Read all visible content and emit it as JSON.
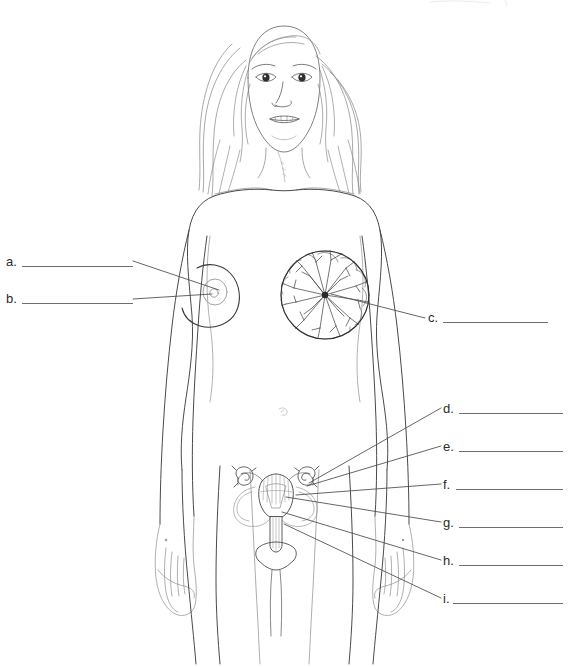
{
  "document": {
    "type": "anatomy-labeling-worksheet",
    "subject": "Female reproductive system and mammary gland",
    "background_color": "#ffffff",
    "ink_color": "#3a3a3a",
    "label_text_color": "#2b2b2b",
    "answer_line_color": "#6e6e6e"
  },
  "figure": {
    "name": "female-body-anterior-view",
    "parts": [
      "head-and-face",
      "long-hair",
      "neck-and-clavicle",
      "torso",
      "left-arm",
      "right-arm",
      "left-hand",
      "right-hand",
      "navel",
      "intact-breast-with-nipple",
      "cutaway-breast-mammary-lobules",
      "uterus-overlay",
      "legs"
    ]
  },
  "labels": {
    "left_column": [
      {
        "id": "a",
        "marker": "a.",
        "marker_x": 6,
        "marker_y": 255,
        "line_x": 22,
        "line_y": 266,
        "line_width": 111,
        "answer": ""
      },
      {
        "id": "b",
        "marker": "b.",
        "marker_x": 6,
        "marker_y": 292,
        "line_x": 22,
        "line_y": 303,
        "line_width": 111,
        "answer": ""
      }
    ],
    "right_column": [
      {
        "id": "c",
        "marker": "c.",
        "marker_x": 428,
        "marker_y": 311,
        "line_x": 443,
        "line_y": 322,
        "line_width": 105,
        "answer": ""
      },
      {
        "id": "d",
        "marker": "d.",
        "marker_x": 443,
        "marker_y": 402,
        "line_x": 459,
        "line_y": 413,
        "line_width": 104,
        "answer": ""
      },
      {
        "id": "e",
        "marker": "e.",
        "marker_x": 443,
        "marker_y": 440,
        "line_x": 459,
        "line_y": 451,
        "line_width": 104,
        "answer": ""
      },
      {
        "id": "f",
        "marker": "f.",
        "marker_x": 443,
        "marker_y": 478,
        "line_x": 456,
        "line_y": 489,
        "line_width": 107,
        "answer": ""
      },
      {
        "id": "g",
        "marker": "g.",
        "marker_x": 443,
        "marker_y": 516,
        "line_x": 459,
        "line_y": 527,
        "line_width": 104,
        "answer": ""
      },
      {
        "id": "h",
        "marker": "h.",
        "marker_x": 443,
        "marker_y": 554,
        "line_x": 459,
        "line_y": 565,
        "line_width": 104,
        "answer": ""
      },
      {
        "id": "i",
        "marker": "i.",
        "marker_x": 443,
        "marker_y": 592,
        "line_x": 453,
        "line_y": 603,
        "line_width": 110,
        "answer": ""
      }
    ]
  },
  "leader_lines": [
    {
      "for": "a",
      "from_x": 133,
      "from_y": 261,
      "to_x": 219,
      "to_y": 290,
      "target": "areola"
    },
    {
      "for": "b",
      "from_x": 133,
      "from_y": 299,
      "to_x": 214,
      "to_y": 294,
      "target": "nipple"
    },
    {
      "for": "c",
      "from_x": 425,
      "from_y": 318,
      "to_x": 331,
      "to_y": 293,
      "target": "mammary-lobules"
    },
    {
      "for": "d",
      "from_x": 441,
      "from_y": 408,
      "to_x": 308,
      "to_y": 484,
      "target": "fallopian-tube"
    },
    {
      "for": "e",
      "from_x": 441,
      "from_y": 446,
      "to_x": 306,
      "to_y": 486,
      "target": "ovary"
    },
    {
      "for": "f",
      "from_x": 441,
      "from_y": 484,
      "to_x": 296,
      "to_y": 495,
      "target": "uterus-fundus"
    },
    {
      "for": "g",
      "from_x": 441,
      "from_y": 522,
      "to_x": 285,
      "to_y": 497,
      "target": "endometrium"
    },
    {
      "for": "h",
      "from_x": 441,
      "from_y": 560,
      "to_x": 281,
      "to_y": 512,
      "target": "cervix"
    },
    {
      "for": "i",
      "from_x": 441,
      "from_y": 598,
      "to_x": 283,
      "to_y": 524,
      "target": "vagina"
    }
  ]
}
